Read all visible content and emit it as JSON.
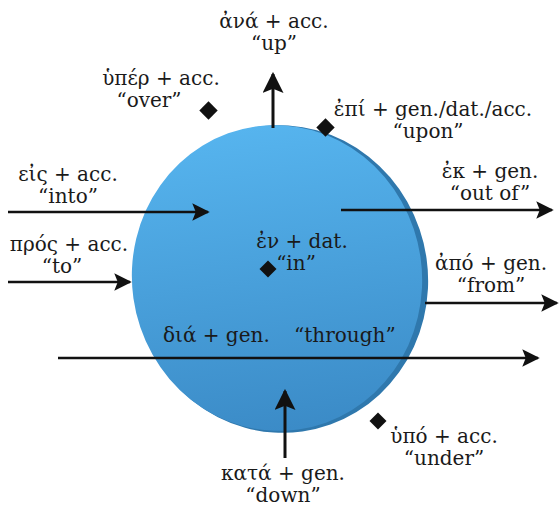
{
  "diagram": {
    "colors": {
      "disc_fill_top": "#55b2ec",
      "disc_fill_bottom": "#3d8fcc",
      "disc_rim": "#2f78ad",
      "arrow": "#111111",
      "text": "#1a1a1a",
      "background": "#ffffff"
    },
    "prepositions": [
      {
        "id": "ana",
        "greek": "ἀνά + acc.",
        "gloss": "“up”",
        "marker": "arrow-up"
      },
      {
        "id": "hyper",
        "greek": "ὑπέρ + acc.",
        "gloss": "“over”",
        "marker": "diamond"
      },
      {
        "id": "epi",
        "greek": "ἐπί + gen./dat./acc.",
        "gloss": "“upon”",
        "marker": "diamond"
      },
      {
        "id": "eis",
        "greek": "εἰς + acc.",
        "gloss": "“into”",
        "marker": "arrow-in"
      },
      {
        "id": "ek",
        "greek": "ἐκ + gen.",
        "gloss": "“out of”",
        "marker": "arrow-out"
      },
      {
        "id": "pros",
        "greek": "πρός + acc.",
        "gloss": "“to”",
        "marker": "arrow-to"
      },
      {
        "id": "en",
        "greek": "ἐν + dat.",
        "gloss": "“in”",
        "marker": "diamond"
      },
      {
        "id": "apo",
        "greek": "ἀπό + gen.",
        "gloss": "“from”",
        "marker": "arrow-from"
      },
      {
        "id": "dia",
        "greek": "διά + gen.",
        "gloss": "“through”",
        "marker": "arrow-through"
      },
      {
        "id": "hypo",
        "greek": "ὑπό + acc.",
        "gloss": "“under”",
        "marker": "diamond"
      },
      {
        "id": "kata",
        "greek": "κατά + gen.",
        "gloss": "“down”",
        "marker": "arrow-down"
      }
    ]
  }
}
